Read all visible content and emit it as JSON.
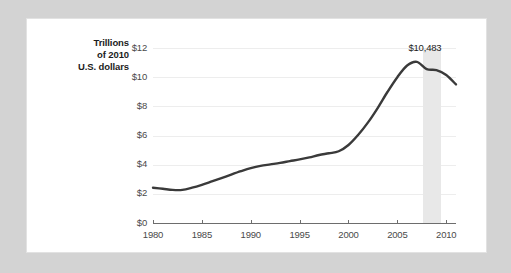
{
  "chart_data": {
    "type": "line",
    "title": "",
    "subtitle": "",
    "xlabel": "",
    "ylabel": "Trillions of 2010 U.S. dollars",
    "ylabel_lines": [
      "Trillions",
      "of 2010",
      "U.S. dollars"
    ],
    "x": [
      1980,
      1981,
      1982,
      1983,
      1984,
      1985,
      1986,
      1987,
      1988,
      1989,
      1990,
      1991,
      1992,
      1993,
      1994,
      1995,
      1996,
      1997,
      1998,
      1999,
      2000,
      2001,
      2002,
      2003,
      2004,
      2005,
      2006,
      2007,
      2008,
      2009,
      2010,
      2011
    ],
    "values": [
      2.42,
      2.35,
      2.27,
      2.27,
      2.42,
      2.62,
      2.85,
      3.08,
      3.32,
      3.55,
      3.76,
      3.92,
      4.02,
      4.12,
      4.24,
      4.36,
      4.5,
      4.66,
      4.78,
      4.92,
      5.35,
      6.05,
      6.9,
      7.9,
      9.0,
      10.0,
      10.8,
      11.05,
      10.55,
      10.48,
      10.15,
      9.5
    ],
    "series": [
      {
        "name": "Household debt",
        "values": [
          2.42,
          2.35,
          2.27,
          2.27,
          2.42,
          2.62,
          2.85,
          3.08,
          3.32,
          3.55,
          3.76,
          3.92,
          4.02,
          4.12,
          4.24,
          4.36,
          4.5,
          4.66,
          4.78,
          4.92,
          5.35,
          6.05,
          6.9,
          7.9,
          9.0,
          10.0,
          10.8,
          11.05,
          10.55,
          10.48,
          10.15,
          9.5
        ]
      }
    ],
    "xlim": [
      1980,
      2011
    ],
    "ylim": [
      0,
      12
    ],
    "ytick_values": [
      0,
      2,
      4,
      6,
      8,
      10,
      12
    ],
    "ytick_labels": [
      "$0",
      "$2",
      "$4",
      "$6",
      "$8",
      "$10",
      "$12"
    ],
    "xtick_values": [
      1980,
      1985,
      1990,
      1995,
      2000,
      2005,
      2010
    ],
    "xtick_labels": [
      "1980",
      "1985",
      "1990",
      "1995",
      "2000",
      "2005",
      "2010"
    ],
    "grid": true,
    "grid_axis": "y",
    "legend": false,
    "legend_position": "none",
    "annotations": [
      {
        "label": "$10,483",
        "x": 2009,
        "y": 10.483,
        "type": "value-callout"
      }
    ],
    "shaded_regions": [
      {
        "name": "recession-band",
        "x_start": 2007.6,
        "x_end": 2009.5,
        "color": "#e8e8e8"
      }
    ],
    "colors": {
      "line": "#3a3a3a",
      "gridline": "#ededed",
      "axis": "#6d6d6d",
      "shading": "#e8e8e8",
      "tick_label": "#4a4a4a",
      "axis_title": "#1c1c1c",
      "card_background": "#ffffff",
      "page_background": "#d3d3d3"
    }
  }
}
